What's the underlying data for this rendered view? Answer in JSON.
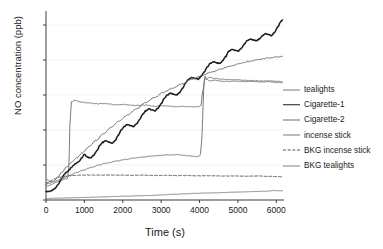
{
  "chart_data": {
    "type": "line",
    "title": "",
    "xlabel": "Time (s)",
    "ylabel": "NO concentration (ppb)",
    "xlim": [
      0,
      6200
    ],
    "ylim": [
      0,
      108
    ],
    "xticks": [
      0,
      1000,
      2000,
      3000,
      4000,
      5000,
      6000
    ],
    "yticks": [
      0,
      20,
      40,
      60,
      80,
      100
    ],
    "grid": "horizontal-faint",
    "legend_position": "right",
    "series": [
      {
        "name": "tealights",
        "color": "#7a7a7a",
        "width": 1.0,
        "dash": "solid",
        "x": [
          0,
          60,
          150,
          260,
          380,
          480,
          560,
          600,
          620,
          660,
          760,
          900,
          1100,
          1320,
          1560,
          1800,
          2050,
          2300,
          2560,
          2820,
          3080,
          3340,
          3600,
          3860,
          3980,
          4040,
          4080,
          4140,
          4260,
          4400,
          4600,
          4850,
          5100,
          5350,
          5600,
          5850,
          6050,
          6150
        ],
        "y": [
          8,
          8,
          9,
          10,
          11,
          12,
          12,
          20,
          42,
          56,
          57,
          56,
          55.5,
          55,
          55,
          54.5,
          54.6,
          54,
          54.2,
          53.6,
          53.8,
          53.4,
          53.5,
          53.2,
          53.4,
          54,
          62,
          69,
          70,
          69.5,
          69,
          68.8,
          68.5,
          68.2,
          68,
          68,
          67.8,
          67.6
        ]
      },
      {
        "name": "Cigarette-1",
        "color": "#1c1c1c",
        "width": 1.5,
        "dash": "solid",
        "x": [
          0,
          60,
          140,
          230,
          320,
          400,
          470,
          540,
          600,
          660,
          720,
          790,
          860,
          930,
          1000,
          1080,
          1160,
          1240,
          1320,
          1400,
          1480,
          1560,
          1640,
          1720,
          1800,
          1880,
          1960,
          2040,
          2120,
          2200,
          2280,
          2360,
          2440,
          2520,
          2600,
          2680,
          2760,
          2840,
          2920,
          3000,
          3080,
          3160,
          3240,
          3320,
          3400,
          3480,
          3560,
          3640,
          3720,
          3800,
          3880,
          3960,
          4040,
          4120,
          4200,
          4280,
          4360,
          4440,
          4520,
          4600,
          4680,
          4760,
          4840,
          4920,
          5000,
          5080,
          5160,
          5240,
          5320,
          5400,
          5480,
          5560,
          5640,
          5720,
          5800,
          5880,
          5960,
          6040,
          6120,
          6160
        ],
        "y": [
          5,
          4.8,
          5.2,
          6.5,
          9,
          12,
          14.5,
          16,
          17,
          18.5,
          20,
          21,
          22,
          24,
          26,
          24.5,
          24,
          25.5,
          28,
          31,
          33,
          34,
          33,
          32.5,
          34,
          37,
          40,
          42,
          43,
          42.5,
          42,
          43.5,
          46,
          49,
          51,
          52,
          51.5,
          51,
          52.5,
          55,
          58,
          60,
          61,
          60.5,
          60,
          61.5,
          64,
          67,
          69,
          70,
          69.5,
          69,
          70.5,
          73,
          76,
          78,
          79,
          78.5,
          78,
          79.5,
          82,
          85,
          86,
          85.5,
          85,
          86.5,
          89,
          91,
          92,
          91.5,
          91,
          92,
          94,
          95,
          94.5,
          94,
          96,
          99,
          102,
          103
        ]
      },
      {
        "name": "Cigarette-2",
        "color": "#6e6e6e",
        "width": 1.0,
        "dash": "solid",
        "x": [
          0,
          80,
          180,
          300,
          420,
          540,
          660,
          800,
          950,
          1120,
          1300,
          1500,
          1700,
          1900,
          2120,
          2350,
          2580,
          2820,
          3060,
          3300,
          3550,
          3800,
          4050,
          4300,
          4550,
          4800,
          5050,
          5300,
          5550,
          5800,
          6050,
          6160
        ],
        "y": [
          10,
          9.5,
          10.5,
          13,
          16,
          19,
          21.5,
          24,
          27,
          30.5,
          34,
          38,
          41.5,
          45,
          48.5,
          52,
          55.5,
          58.5,
          61.5,
          64,
          66.5,
          69,
          71,
          73,
          74.8,
          76.5,
          78,
          79.2,
          80.3,
          81.2,
          81.8,
          82
        ]
      },
      {
        "name": "incense stick",
        "color": "#7a7a7a",
        "width": 1.0,
        "dash": "solid",
        "x": [
          0,
          80,
          180,
          300,
          440,
          600,
          780,
          960,
          1160,
          1380,
          1600,
          1840,
          2080,
          2320,
          2560,
          2800,
          3040,
          3280,
          3420,
          3560,
          3700,
          3840,
          3960,
          4020,
          4060,
          4090,
          4110,
          4140,
          4180,
          4260,
          4380,
          4520,
          4700,
          4900,
          5120,
          5350,
          5580,
          5800,
          6020,
          6160
        ],
        "y": [
          12,
          11,
          10.5,
          11,
          12.5,
          14,
          15.5,
          17,
          18.5,
          20,
          21.2,
          22.3,
          23.2,
          24,
          24.6,
          25.2,
          25.6,
          25.8,
          25.9,
          25.6,
          25.3,
          25,
          24.8,
          25.5,
          35,
          52,
          65,
          71,
          69,
          68,
          68.5,
          68,
          67.8,
          68,
          67.6,
          67.8,
          67.4,
          67.6,
          67.2,
          67
        ]
      },
      {
        "name": "BKG incense stick",
        "color": "#555555",
        "width": 1.0,
        "dash": "dashed",
        "x": [
          0,
          100,
          220,
          360,
          520,
          700,
          900,
          1120,
          1360,
          1620,
          1900,
          2200,
          2500,
          2800,
          3100,
          3400,
          3700,
          4000,
          4300,
          4600,
          4900,
          5200,
          5500,
          5800,
          6060,
          6160
        ],
        "y": [
          9,
          10.5,
          12,
          13,
          13.6,
          14,
          14.2,
          14.3,
          14.2,
          14.3,
          14.2,
          14.1,
          14.2,
          14,
          14.1,
          13.9,
          14,
          13.8,
          13.9,
          13.7,
          13.8,
          13.6,
          13.7,
          13.5,
          13.4,
          13.3
        ]
      },
      {
        "name": "BKG tealights",
        "color": "#828282",
        "width": 1.0,
        "dash": "solid",
        "x": [
          0,
          120,
          260,
          420,
          600,
          800,
          1020,
          1260,
          1520,
          1800,
          2100,
          2400,
          2700,
          3000,
          3300,
          3600,
          3900,
          4200,
          4500,
          4800,
          5100,
          5400,
          5700,
          6000,
          6160
        ],
        "y": [
          0.8,
          0.9,
          1.0,
          1.1,
          1.2,
          1.3,
          1.5,
          1.6,
          1.8,
          2.0,
          2.2,
          2.4,
          2.6,
          2.9,
          3.2,
          3.5,
          3.8,
          4.0,
          4.2,
          4.4,
          4.6,
          4.8,
          5.0,
          5.4,
          5.2
        ]
      }
    ]
  },
  "axes": {
    "ylabel": "NO concentration (ppb)",
    "xlabel": "Time (s)",
    "ytick_labels": [
      "0",
      "20",
      "40",
      "60",
      "80",
      "100"
    ],
    "xtick_labels": [
      "0",
      "1000",
      "2000",
      "3000",
      "4000",
      "5000",
      "6000"
    ]
  },
  "legend": {
    "items": [
      {
        "label": "tealights"
      },
      {
        "label": "Cigarette-1"
      },
      {
        "label": "Cigarette-2"
      },
      {
        "label": "incense stick"
      },
      {
        "label": "BKG incense stick"
      },
      {
        "label": "BKG tealights"
      }
    ]
  }
}
